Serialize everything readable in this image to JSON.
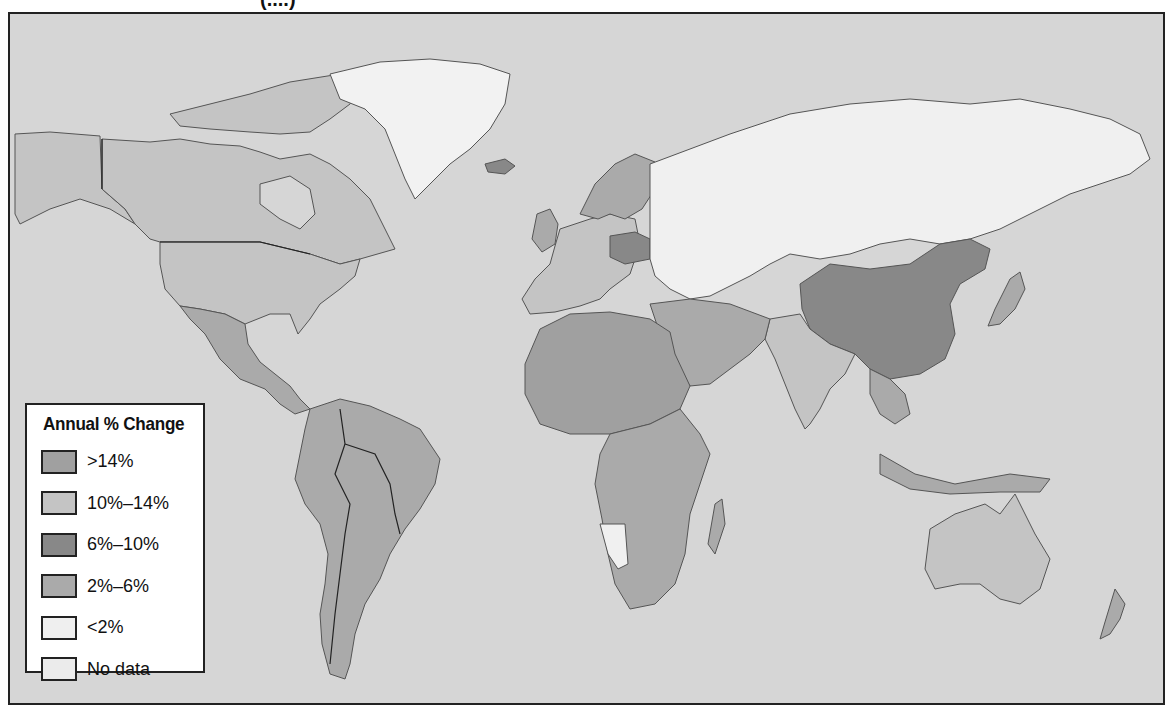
{
  "map": {
    "title_fragment": "(....)",
    "ocean_color": "#d6d6d6",
    "legend": {
      "title": "Annual % Change",
      "items": [
        {
          "label": ">14%",
          "color": "#a0a0a0"
        },
        {
          "label": "10%–14%",
          "color": "#c4c4c4"
        },
        {
          "label": "6%–10%",
          "color": "#888888"
        },
        {
          "label": "2%–6%",
          "color": "#aaaaaa"
        },
        {
          "label": "<2%",
          "color": "#efefef"
        },
        {
          "label": "No data",
          "color": "#ebebeb"
        }
      ]
    },
    "regions": [
      {
        "name": "Canada",
        "category": "10%–14%"
      },
      {
        "name": "United States",
        "category": "10%–14%"
      },
      {
        "name": "Alaska",
        "category": "10%–14%"
      },
      {
        "name": "Greenland",
        "category": "<2%"
      },
      {
        "name": "Mexico",
        "category": "2%–6%"
      },
      {
        "name": "Central America",
        "category": "2%–6%"
      },
      {
        "name": "South America",
        "category": "2%–6%"
      },
      {
        "name": "Western Europe",
        "category": "10%–14%"
      },
      {
        "name": "Poland",
        "category": "6%–10%"
      },
      {
        "name": "Eastern Europe",
        "category": "<2%"
      },
      {
        "name": "Russia",
        "category": "<2%"
      },
      {
        "name": "Central Asia",
        "category": "<2%"
      },
      {
        "name": "China",
        "category": "6%–10%"
      },
      {
        "name": "India",
        "category": "10%–14%"
      },
      {
        "name": "Japan",
        "category": "2%–6%"
      },
      {
        "name": "Southeast Asia",
        "category": "2%–6%"
      },
      {
        "name": "Middle East",
        "category": "2%–6%"
      },
      {
        "name": "North Africa",
        "category": ">14%"
      },
      {
        "name": "Central Africa",
        "category": "2%–6%"
      },
      {
        "name": "Southern Africa",
        "category": "2%–6%"
      },
      {
        "name": "Namibia",
        "category": "<2%"
      },
      {
        "name": "Madagascar",
        "category": "2%–6%"
      },
      {
        "name": "Australia",
        "category": "10%–14%"
      },
      {
        "name": "New Zealand",
        "category": "2%–6%"
      },
      {
        "name": "Iceland",
        "category": "6%–10%"
      }
    ]
  }
}
